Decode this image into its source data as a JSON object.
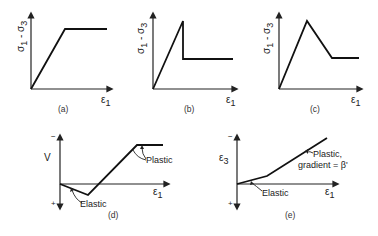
{
  "figure": {
    "panels": [
      {
        "id": "a",
        "caption": "(a)",
        "y_label": "σ1 - σ3",
        "x_label": "ε1",
        "description": "Linear rise then flat plateau (elastic-perfectly plastic)"
      },
      {
        "id": "b",
        "caption": "(b)",
        "y_label": "σ1 - σ3",
        "x_label": "ε1",
        "description": "Linear rise to peak, sudden drop, then flat residual (brittle)"
      },
      {
        "id": "c",
        "caption": "(c)",
        "y_label": "σ1 - σ3",
        "x_label": "ε1",
        "description": "Linear rise to peak, gradual linear softening, then flat residual"
      },
      {
        "id": "d",
        "caption": "(d)",
        "y_label": "V",
        "x_label": "ε1",
        "y_top_sign": "−",
        "y_bottom_sign": "+",
        "annotations": [
          "Elastic",
          "Plastic"
        ],
        "description": "Volumetric strain: elastic compaction then plastic dilation, then constant"
      },
      {
        "id": "e",
        "caption": "(e)",
        "y_label": "ε3",
        "x_label": "ε1",
        "y_top_sign": "−",
        "y_bottom_sign": "+",
        "annotations": [
          "Elastic",
          "Plastic,",
          "gradient = β'"
        ],
        "description": "Lateral strain vs axial strain: shallow elastic segment then steeper plastic segment of gradient β'"
      }
    ]
  },
  "labels": {
    "sigma_a": "σ",
    "sub1": "1",
    "dash": " - ",
    "sub3": "3",
    "eps": "ε",
    "cap_a": "(a)",
    "cap_b": "(b)",
    "cap_c": "(c)",
    "cap_d": "(d)",
    "cap_e": "(e)",
    "V": "V",
    "minus": "−",
    "plus": "+",
    "elastic": "Elastic",
    "plastic": "Plastic",
    "plastic_comma": "Plastic,",
    "gradient": "gradient = β'"
  }
}
